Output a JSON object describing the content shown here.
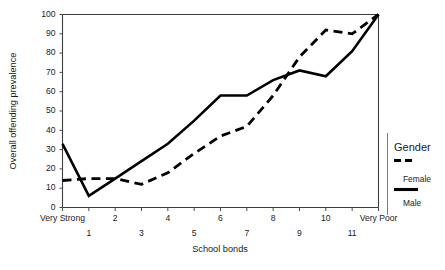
{
  "chart_data": {
    "type": "line",
    "title": "",
    "xlabel": "School bonds",
    "ylabel": "Overall offending prevalence",
    "categories": [
      "Very Strong",
      "1",
      "2",
      "3",
      "4",
      "5",
      "6",
      "7",
      "8",
      "9",
      "10",
      "11",
      "Very Poor"
    ],
    "ylim": [
      0,
      100
    ],
    "yticks": [
      0,
      10,
      20,
      30,
      40,
      50,
      60,
      70,
      80,
      90,
      100
    ],
    "ytick_labels": [
      "0",
      "10",
      "20",
      "30",
      "40",
      "50",
      "60",
      "70",
      "80",
      "90",
      "100"
    ],
    "grid": false,
    "legend_position": "right",
    "legend_title": "Gender",
    "series": [
      {
        "name": "Female",
        "style": "dashed",
        "color": "#000000",
        "values": [
          14,
          15,
          15,
          12,
          18,
          28,
          37,
          42,
          58,
          78,
          92,
          90,
          100
        ]
      },
      {
        "name": "Male",
        "style": "solid",
        "color": "#000000",
        "values": [
          33,
          6,
          15,
          24,
          33,
          45,
          58,
          58,
          66,
          71,
          68,
          81,
          100
        ]
      }
    ]
  },
  "axes": {
    "y_axis_title": "Overall offending prevalence",
    "x_axis_title": "School bonds"
  },
  "legend": {
    "title": "Gender",
    "entries": [
      {
        "label": "Female",
        "style": "dashed"
      },
      {
        "label": "Male",
        "style": "solid"
      }
    ]
  }
}
